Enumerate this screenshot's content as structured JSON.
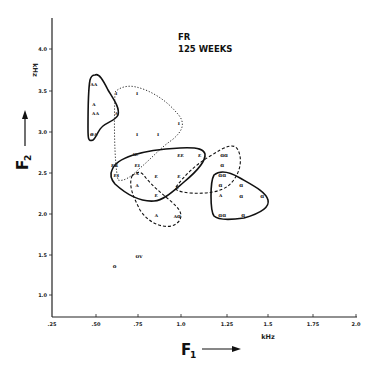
{
  "title": {
    "line1": "FR",
    "line2": "125 WEEKS"
  },
  "axes": {
    "x_name": "F",
    "x_sub": "1",
    "x_unit": "kHz",
    "y_name": "F",
    "y_sub": "2",
    "y_unit": "kHz",
    "x_ticks": [
      ".25",
      ".50",
      ".75",
      "1.0",
      "1.25",
      "1.5",
      "1.75",
      "2.0"
    ],
    "y_ticks": [
      "1.0",
      "1.5",
      "2.0",
      "2.5",
      "3.0",
      "3.5",
      "4.0"
    ]
  },
  "chart_data": {
    "type": "scatter",
    "xlabel": "F1 (kHz)",
    "ylabel": "F2 (kHz)",
    "xlim": [
      0.25,
      2.0
    ],
    "ylim": [
      0.75,
      4.3
    ],
    "x_ticks": [
      0.25,
      0.5,
      0.75,
      1.0,
      1.25,
      1.5,
      1.75,
      2.0
    ],
    "y_ticks": [
      1.0,
      1.5,
      2.0,
      2.5,
      3.0,
      3.5,
      4.0
    ],
    "grid": false,
    "legend": null,
    "points": [
      {
        "label": "ʌʌ",
        "f1": 0.49,
        "f2": 3.57
      },
      {
        "label": "ʌ",
        "f1": 0.49,
        "f2": 3.33
      },
      {
        "label": "ʌʌ",
        "f1": 0.5,
        "f2": 3.22
      },
      {
        "label": "øʌ",
        "f1": 0.49,
        "f2": 2.96
      },
      {
        "label": "ʌ",
        "f1": 0.62,
        "f2": 3.22
      },
      {
        "label": "ɪ",
        "f1": 0.62,
        "f2": 3.46
      },
      {
        "label": "ɪ",
        "f1": 0.74,
        "f2": 3.46
      },
      {
        "label": "ɪ",
        "f1": 0.98,
        "f2": 3.1
      },
      {
        "label": "ɪ",
        "f1": 0.74,
        "f2": 2.96
      },
      {
        "label": "ɪ",
        "f1": 0.86,
        "f2": 2.97
      },
      {
        "label": "ɪɛ",
        "f1": 0.73,
        "f2": 2.72
      },
      {
        "label": "ɛɛ",
        "f1": 0.99,
        "f2": 2.71
      },
      {
        "label": "ɛ",
        "f1": 1.1,
        "f2": 2.71
      },
      {
        "label": "ɛʀ",
        "f1": 0.61,
        "f2": 2.59
      },
      {
        "label": "ɛɪ",
        "f1": 0.74,
        "f2": 2.58
      },
      {
        "label": "ɛɪ",
        "f1": 0.62,
        "f2": 2.46
      },
      {
        "label": "ɛ",
        "f1": 0.85,
        "f2": 2.45
      },
      {
        "label": "ɛ",
        "f1": 0.98,
        "f2": 2.45
      },
      {
        "label": "ɛ",
        "f1": 0.97,
        "f2": 2.32
      },
      {
        "label": "ɛ",
        "f1": 0.85,
        "f2": 2.22
      },
      {
        "label": "ʌ",
        "f1": 0.74,
        "f2": 2.49
      },
      {
        "label": "ʌ",
        "f1": 0.74,
        "f2": 2.34
      },
      {
        "label": "ʌ",
        "f1": 0.85,
        "f2": 1.98
      },
      {
        "label": "ʌɑ",
        "f1": 0.97,
        "f2": 1.97
      },
      {
        "label": "ɑɑ",
        "f1": 1.24,
        "f2": 2.71
      },
      {
        "label": "ɑ",
        "f1": 1.23,
        "f2": 2.59
      },
      {
        "label": "ɑɑ",
        "f1": 1.23,
        "f2": 2.47
      },
      {
        "label": "ɑ",
        "f1": 1.22,
        "f2": 2.34
      },
      {
        "label": "ɑ",
        "f1": 1.34,
        "f2": 2.34
      },
      {
        "label": "ʌ",
        "f1": 1.22,
        "f2": 2.22
      },
      {
        "label": "ɑ",
        "f1": 1.34,
        "f2": 2.21
      },
      {
        "label": "ɑ",
        "f1": 1.46,
        "f2": 2.21
      },
      {
        "label": "ɑɑ",
        "f1": 1.23,
        "f2": 1.98
      },
      {
        "label": "ɑ",
        "f1": 1.35,
        "f2": 1.98
      },
      {
        "label": "ʊv",
        "f1": 0.75,
        "f2": 1.48
      },
      {
        "label": "o",
        "f1": 0.61,
        "f2": 1.35
      }
    ],
    "regions": [
      {
        "name": "ʌ-region (solid)",
        "style": "solid"
      },
      {
        "name": "ɪ-region (dotted)",
        "style": "dotted"
      },
      {
        "name": "ɛ-region (solid)",
        "style": "solid"
      },
      {
        "name": "ʌ-region (dashed)",
        "style": "dashed"
      },
      {
        "name": "ɑ-upper (dashed)",
        "style": "dashed"
      },
      {
        "name": "ɑ-region (solid)",
        "style": "solid"
      }
    ]
  }
}
